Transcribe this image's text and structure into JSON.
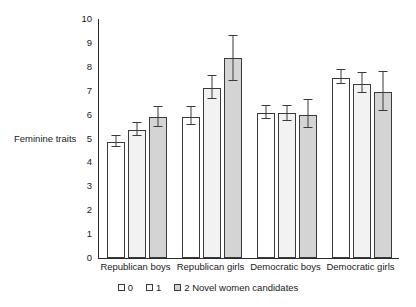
{
  "chart_data": {
    "type": "bar",
    "title": "",
    "xlabel": "",
    "ylabel": "Feminine traits",
    "ylim": [
      0,
      10
    ],
    "ytick_labels": [
      "10",
      "9",
      "8",
      "7",
      "6",
      "5",
      "4",
      "3",
      "2",
      "1",
      "0"
    ],
    "ytick_values": [
      10,
      9,
      8,
      7,
      6,
      5,
      4,
      3,
      2,
      1,
      0
    ],
    "grid": false,
    "legend_position": "bottom",
    "categories": [
      "Republican boys",
      "Republican girls",
      "Democratic boys",
      "Democratic girls"
    ],
    "series": [
      {
        "name": "0",
        "values": [
          4.85,
          5.9,
          6.05,
          7.55
        ],
        "err_low": [
          4.65,
          5.55,
          5.8,
          7.3
        ],
        "err_high": [
          5.1,
          6.3,
          6.35,
          7.85
        ]
      },
      {
        "name": "1",
        "values": [
          5.35,
          7.1,
          6.05,
          7.3
        ],
        "err_low": [
          5.1,
          6.65,
          5.75,
          6.9
        ],
        "err_high": [
          5.65,
          7.6,
          6.35,
          7.75
        ]
      },
      {
        "name": "2 Novel women candidates",
        "values": [
          5.9,
          8.35,
          6.0,
          6.95
        ],
        "err_low": [
          5.5,
          7.4,
          5.45,
          6.15
        ],
        "err_high": [
          6.3,
          9.3,
          6.6,
          7.8
        ]
      }
    ]
  }
}
